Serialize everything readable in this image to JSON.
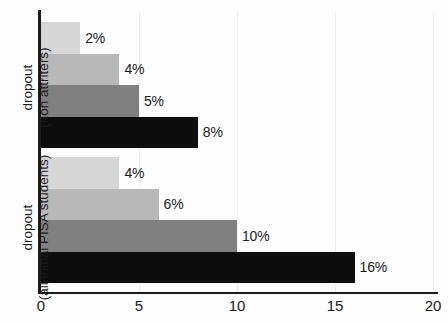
{
  "chart_data": {
    "type": "bar",
    "orientation": "horizontal",
    "title": "",
    "xlabel": "",
    "ylabel": "",
    "xlim": [
      0,
      20
    ],
    "xticks": [
      0,
      5,
      10,
      15,
      20
    ],
    "xtick_labels": [
      "0",
      "5",
      "10",
      "15",
      "20"
    ],
    "grid": true,
    "legend": "none",
    "value_suffix": "%",
    "groups": [
      {
        "name": "dropout-non-attriters",
        "label_lines": [
          "dropout",
          "(non attriters)"
        ],
        "bars": [
          {
            "value": 2,
            "data_label": "2%",
            "color": "#d6d6d6"
          },
          {
            "value": 4,
            "data_label": "4%",
            "color": "#b8b8b8"
          },
          {
            "value": 5,
            "data_label": "5%",
            "color": "#808080"
          },
          {
            "value": 8,
            "data_label": "8%",
            "color": "#0d0d0d"
          }
        ]
      },
      {
        "name": "dropout-all-initial-pisa-students",
        "label_lines": [
          "dropout",
          "(all initial PISA students)"
        ],
        "bars": [
          {
            "value": 4,
            "data_label": "4%",
            "color": "#d6d6d6"
          },
          {
            "value": 6,
            "data_label": "6%",
            "color": "#b8b8b8"
          },
          {
            "value": 10,
            "data_label": "10%",
            "color": "#808080"
          },
          {
            "value": 16,
            "data_label": "16%",
            "color": "#0d0d0d"
          }
        ]
      }
    ],
    "series_shades": [
      "#d6d6d6",
      "#b8b8b8",
      "#808080",
      "#0d0d0d"
    ],
    "categories": [
      "dropout (non attriters)",
      "dropout (all initial PISA students)"
    ],
    "series": [
      {
        "name": "shade-1-lightest",
        "values": [
          2,
          4
        ]
      },
      {
        "name": "shade-2-light",
        "values": [
          4,
          6
        ]
      },
      {
        "name": "shade-3-mid",
        "values": [
          5,
          10
        ]
      },
      {
        "name": "shade-4-black",
        "values": [
          8,
          16
        ]
      }
    ]
  }
}
